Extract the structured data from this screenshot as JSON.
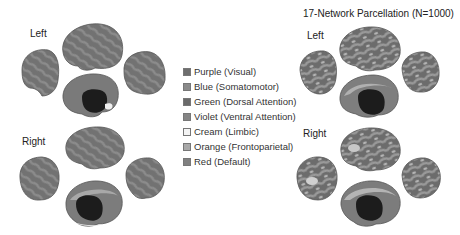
{
  "panels": {
    "left_panel": {
      "hemisphere_labels": {
        "left": "Left",
        "right": "Right"
      }
    },
    "right_panel": {
      "title": "17-Network Parcellation (N=1000)",
      "hemisphere_labels": {
        "left": "Left",
        "right": "Right"
      }
    }
  },
  "legend": {
    "items": [
      {
        "label": "Purple (Visual)",
        "color": "#6e6e6e"
      },
      {
        "label": "Blue (Somatomotor)",
        "color": "#8a8a8a"
      },
      {
        "label": "Green (Dorsal Attention)",
        "color": "#6a6a6a"
      },
      {
        "label": "Violet (Ventral Attention)",
        "color": "#858585"
      },
      {
        "label": "Cream (Limbic)",
        "color": "#f4f4f4"
      },
      {
        "label": "Orange (Frontoparietal)",
        "color": "#a8a8a8"
      },
      {
        "label": "Red (Default)",
        "color": "#808080"
      }
    ]
  },
  "colors": {
    "cortex_dark": "#5c5c5c",
    "cortex_mid": "#7a7a7a",
    "cortex_light": "#a5a5a5",
    "medial_wall": "#1c1c1c"
  }
}
